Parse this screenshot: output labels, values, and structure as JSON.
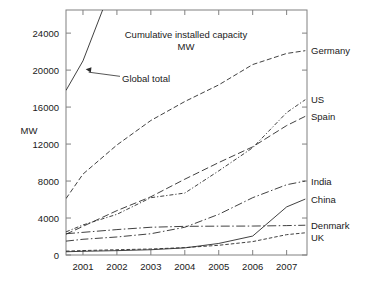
{
  "chart_data": {
    "type": "line",
    "title": "Cumulative installed capacity",
    "title_line2": "MW",
    "xlabel": "",
    "ylabel": "MW",
    "xlim": [
      2000.5,
      2007.6
    ],
    "ylim": [
      0,
      26500
    ],
    "yticks": [
      0,
      4000,
      8000,
      12000,
      16000,
      20000,
      24000
    ],
    "ytick_labels": [
      "0",
      "4000",
      "8000",
      "12000",
      "16000",
      "20000",
      "24000"
    ],
    "xticks": [
      2001,
      2002,
      2003,
      2004,
      2005,
      2006,
      2007
    ],
    "xtick_labels": [
      "2001",
      "2002",
      "2003",
      "2004",
      "2005",
      "2006",
      "2007"
    ],
    "grid": false,
    "legend_position": "right-outside-labels",
    "annotations": [
      {
        "text": "Global total",
        "x": 2002.15,
        "y": 19000,
        "points_to_x": 2001.05,
        "points_to_y": 20100
      }
    ],
    "x": [
      2000.5,
      2001,
      2002,
      2003,
      2004,
      2005,
      2006,
      2007,
      2007.55
    ],
    "series": [
      {
        "name": "Global total",
        "label": "Global total",
        "style": "solid",
        "clipped_above_axis": true,
        "x": [
          2000.5,
          2001,
          2002
        ],
        "values": [
          17800,
          21000,
          30500
        ]
      },
      {
        "name": "Germany",
        "label": "Germany",
        "style": "dashed",
        "values": [
          6100,
          8750,
          11900,
          14550,
          16600,
          18400,
          20600,
          21800,
          22100
        ]
      },
      {
        "name": "US",
        "label": "US",
        "style": "dash-dot-dense",
        "values": [
          2500,
          3250,
          4400,
          6200,
          6700,
          9100,
          11600,
          15400,
          16800
        ]
      },
      {
        "name": "Spain",
        "label": "Spain",
        "style": "long-dash",
        "values": [
          2250,
          3100,
          4800,
          6300,
          8200,
          10000,
          11700,
          14000,
          15000
        ]
      },
      {
        "name": "India",
        "label": "India",
        "style": "dash-dot",
        "values": [
          1500,
          1700,
          1950,
          2300,
          3000,
          4400,
          6200,
          7600,
          8000
        ]
      },
      {
        "name": "China",
        "label": "China",
        "style": "solid",
        "values": [
          350,
          400,
          470,
          570,
          770,
          1250,
          2050,
          5200,
          6050
        ]
      },
      {
        "name": "Denmark",
        "label": "Denmark",
        "style": "dash-dot-long",
        "values": [
          2300,
          2450,
          2750,
          3000,
          3100,
          3120,
          3130,
          3180,
          3220
        ]
      },
      {
        "name": "UK",
        "label": "UK",
        "style": "dashed-fine",
        "values": [
          420,
          480,
          570,
          650,
          800,
          1050,
          1450,
          2200,
          2400
        ]
      }
    ]
  },
  "axes": {
    "y_axis_title": "MW"
  }
}
